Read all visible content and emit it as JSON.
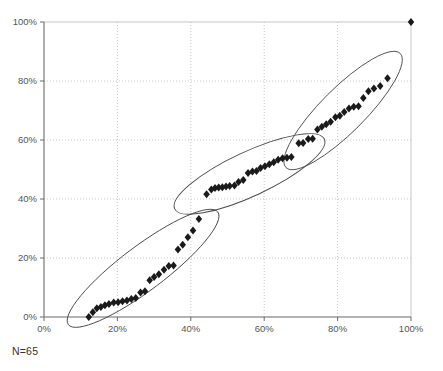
{
  "chart_data": {
    "type": "scatter",
    "title": "",
    "subtitle": "",
    "xlabel": "",
    "ylabel": "",
    "xlim": [
      0,
      100
    ],
    "ylim": [
      0,
      100
    ],
    "grid": true,
    "legend": "none",
    "x_ticks": [
      "0%",
      "20%",
      "40%",
      "60%",
      "80%",
      "100%"
    ],
    "y_ticks": [
      "0%",
      "20%",
      "40%",
      "60%",
      "80%",
      "100%"
    ],
    "x_tick_values": [
      0,
      20,
      40,
      60,
      80,
      100
    ],
    "y_tick_values": [
      0,
      20,
      40,
      60,
      80,
      100
    ],
    "marker": "diamond",
    "marker_color": "#1a1a1a",
    "marker_size": 4,
    "annotation": "N=65",
    "series": [
      {
        "name": "cumulative-distribution",
        "points": [
          [
            12.2,
            0.0
          ],
          [
            13.3,
            1.6
          ],
          [
            14.4,
            3.0
          ],
          [
            15.5,
            3.4
          ],
          [
            16.6,
            4.0
          ],
          [
            17.7,
            4.4
          ],
          [
            19.0,
            4.9
          ],
          [
            20.2,
            5.0
          ],
          [
            21.4,
            5.3
          ],
          [
            22.6,
            5.6
          ],
          [
            23.8,
            6.1
          ],
          [
            25.0,
            6.4
          ],
          [
            26.3,
            8.3
          ],
          [
            27.5,
            8.7
          ],
          [
            28.8,
            12.5
          ],
          [
            30.0,
            13.6
          ],
          [
            31.3,
            14.5
          ],
          [
            32.7,
            16.0
          ],
          [
            34.0,
            17.3
          ],
          [
            35.3,
            17.5
          ],
          [
            36.5,
            22.9
          ],
          [
            37.8,
            24.5
          ],
          [
            39.2,
            27.0
          ],
          [
            40.6,
            29.3
          ],
          [
            42.2,
            33.2
          ],
          [
            44.3,
            41.6
          ],
          [
            45.6,
            43.2
          ],
          [
            46.6,
            43.7
          ],
          [
            47.6,
            43.9
          ],
          [
            48.6,
            44.0
          ],
          [
            49.6,
            44.2
          ],
          [
            50.6,
            44.4
          ],
          [
            51.9,
            44.6
          ],
          [
            53.0,
            45.8
          ],
          [
            54.3,
            46.4
          ],
          [
            55.6,
            48.8
          ],
          [
            56.8,
            49.3
          ],
          [
            57.9,
            49.5
          ],
          [
            59.0,
            50.5
          ],
          [
            60.2,
            51.1
          ],
          [
            61.4,
            51.8
          ],
          [
            62.6,
            52.5
          ],
          [
            63.8,
            53.3
          ],
          [
            65.0,
            53.8
          ],
          [
            66.2,
            54.0
          ],
          [
            67.4,
            54.2
          ],
          [
            69.4,
            58.9
          ],
          [
            70.6,
            59.0
          ],
          [
            72.0,
            60.3
          ],
          [
            73.2,
            60.4
          ],
          [
            74.5,
            63.6
          ],
          [
            75.7,
            64.5
          ],
          [
            76.9,
            65.3
          ],
          [
            78.1,
            66.2
          ],
          [
            79.4,
            67.7
          ],
          [
            80.6,
            68.2
          ],
          [
            81.8,
            69.5
          ],
          [
            83.1,
            70.7
          ],
          [
            84.4,
            71.3
          ],
          [
            85.7,
            71.4
          ],
          [
            87.0,
            74.2
          ],
          [
            88.4,
            76.5
          ],
          [
            89.9,
            77.5
          ],
          [
            91.6,
            78.3
          ],
          [
            93.6,
            80.9
          ],
          [
            100.0,
            100.0
          ]
        ]
      }
    ],
    "ellipses": [
      {
        "name": "cluster-lower-left",
        "cx": 27.0,
        "cy": 16.5,
        "rx": 25.5,
        "ry": 7.5,
        "rotation_deg": -37.0
      },
      {
        "name": "cluster-middle",
        "cx": 56.0,
        "cy": 48.5,
        "rx": 22.5,
        "ry": 7.5,
        "rotation_deg": -25.0
      },
      {
        "name": "cluster-upper-right",
        "cx": 81.5,
        "cy": 70.0,
        "rx": 22.0,
        "ry": 7.5,
        "rotation_deg": -45.0
      }
    ]
  },
  "colors": {
    "axis": "#6b6b6b",
    "grid": "#b9b9b9",
    "marker": "#1a1a1a",
    "ellipse": "#4a4a4a",
    "text": "#444444"
  },
  "annotation": {
    "sample_size_label": "N=65"
  }
}
